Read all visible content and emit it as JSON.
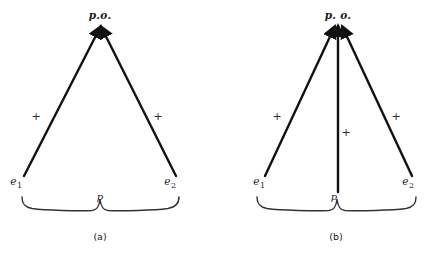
{
  "figure": {
    "background_color": "#ffffff",
    "ink_color": "#111111",
    "width": 435,
    "height": 262
  },
  "panels": [
    {
      "id": "a",
      "caption": "(a)",
      "caption_pos": {
        "x": 100,
        "y": 238
      },
      "apex_label": "p.o.",
      "apex_label_pos": {
        "x": 100,
        "y": 16
      },
      "apex_point": {
        "x": 100,
        "y": 32
      },
      "vectors": [
        {
          "name": "vector-e1-to-po",
          "from_label": "e1",
          "from_text": "e",
          "from_sub": "1",
          "from_label_pos": {
            "x": 16,
            "y": 183
          },
          "start": {
            "x": 24,
            "y": 176
          },
          "end": {
            "x": 95,
            "y": 33
          },
          "sign": "+",
          "sign_pos": {
            "x": 36,
            "y": 117
          }
        },
        {
          "name": "vector-e2-to-po",
          "from_label": "e2",
          "from_text": "e",
          "from_sub": "2",
          "from_label_pos": {
            "x": 166,
            "y": 183
          },
          "start": {
            "x": 176,
            "y": 176
          },
          "end": {
            "x": 106,
            "y": 33
          },
          "sign": "+",
          "sign_pos": {
            "x": 158,
            "y": 117
          }
        }
      ],
      "brace": {
        "name": "baseline-brace",
        "left": 22,
        "right": 179,
        "center": 100,
        "top": 196,
        "bottom": 210,
        "label": "p",
        "label_pos": {
          "x": 100,
          "y": 199
        }
      }
    },
    {
      "id": "b",
      "caption": "(b)",
      "caption_pos": {
        "x": 336,
        "y": 238
      },
      "apex_label": "p. o.",
      "apex_label_pos": {
        "x": 338,
        "y": 16
      },
      "apex_point": {
        "x": 338,
        "y": 32
      },
      "vectors": [
        {
          "name": "vector-e1-to-po",
          "from_label": "e1",
          "from_text": "e",
          "from_sub": "1",
          "from_label_pos": {
            "x": 258,
            "y": 183
          },
          "start": {
            "x": 265,
            "y": 176
          },
          "end": {
            "x": 330,
            "y": 33
          },
          "sign": "+",
          "sign_pos": {
            "x": 277,
            "y": 117
          }
        },
        {
          "name": "vector-p-to-po",
          "from_label": "p",
          "from_text": "p",
          "from_sub": "",
          "from_label_pos": {
            "x": 336,
            "y": 200
          },
          "start": {
            "x": 338,
            "y": 192
          },
          "end": {
            "x": 338,
            "y": 33
          },
          "sign": "+",
          "sign_pos": {
            "x": 345,
            "y": 133
          }
        },
        {
          "name": "vector-e2-to-po",
          "from_label": "e2",
          "from_text": "e",
          "from_sub": "2",
          "from_label_pos": {
            "x": 404,
            "y": 183
          },
          "start": {
            "x": 412,
            "y": 176
          },
          "end": {
            "x": 347,
            "y": 33
          },
          "sign": "+",
          "sign_pos": {
            "x": 396,
            "y": 117
          }
        }
      ],
      "brace": {
        "name": "baseline-brace",
        "left": 257,
        "right": 416,
        "center": 337,
        "top": 196,
        "bottom": 210,
        "label": "p",
        "label_pos": {
          "x": 337,
          "y": 199
        }
      }
    }
  ]
}
